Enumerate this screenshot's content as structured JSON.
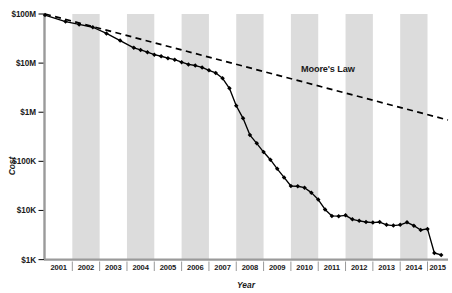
{
  "chart_data": {
    "type": "line",
    "title": "",
    "xlabel": "Year",
    "ylabel": "Cost",
    "yscale": "log",
    "ylim": [
      1000,
      100000000
    ],
    "ytick_labels": [
      "$100M",
      "$10M",
      "$1M",
      "$100K",
      "$10K",
      "$1K"
    ],
    "ytick_values": [
      100000000,
      10000000,
      1000000,
      100000,
      10000,
      1000
    ],
    "xtick_labels": [
      "2001",
      "2002",
      "2003",
      "2004",
      "2005",
      "2006",
      "2007",
      "2008",
      "2009",
      "2010",
      "2011",
      "2012",
      "2013",
      "2014",
      "2015"
    ],
    "xlim": [
      2001,
      2015.75
    ],
    "grid": false,
    "legend_position": "inline-annotation",
    "bands": "alternating vertical gray bands on even years",
    "band_color": "#dcdcdc",
    "line_color": "#000000",
    "marker": "filled-diamond",
    "annotations": [
      {
        "text": "Moore's Law",
        "x": 2011.1,
        "y": 2600000
      }
    ],
    "series": [
      {
        "name": "Cost per Genome",
        "style": "solid-with-markers",
        "x": [
          2001.0,
          2001.75,
          2002.25,
          2002.75,
          2003.25,
          2003.75,
          2004.25,
          2004.5,
          2004.75,
          2005.0,
          2005.25,
          2005.5,
          2005.75,
          2006.0,
          2006.25,
          2006.5,
          2006.75,
          2007.0,
          2007.25,
          2007.5,
          2007.75,
          2008.0,
          2008.25,
          2008.5,
          2008.75,
          2009.0,
          2009.25,
          2009.5,
          2009.75,
          2010.0,
          2010.25,
          2010.5,
          2010.75,
          2011.0,
          2011.25,
          2011.5,
          2011.75,
          2012.0,
          2012.25,
          2012.5,
          2012.75,
          2013.0,
          2013.25,
          2013.5,
          2013.75,
          2014.0,
          2014.25,
          2014.5,
          2014.75,
          2015.0,
          2015.25,
          2015.5
        ],
        "y": [
          95263072,
          70175437,
          61448422,
          53751684,
          40157554,
          28780376,
          20442576,
          18519312,
          16712371,
          14843121,
          13801124,
          12587002,
          11732535,
          10474556,
          9408739,
          8927342,
          8157530,
          7147571,
          6300000,
          4905850,
          3063820,
          1352982,
          752080,
          342502,
          232735,
          154714,
          108065,
          70333,
          47079,
          31512,
          31125,
          29092,
          23092,
          16712,
          10497,
          7743,
          7666,
          7950,
          6618,
          6168,
          5826,
          5671,
          5826,
          5096,
          4920,
          5096,
          5731,
          4905,
          4008,
          4211,
          1363,
          1245
        ]
      },
      {
        "name": "Moore's Law",
        "style": "dashed",
        "x": [
          2001.0,
          2015.75
        ],
        "y": [
          100000000,
          695000
        ]
      }
    ]
  },
  "axes": {
    "y_title": "Cost",
    "x_title": "Year",
    "y_ticks": [
      "$100M",
      "$10M",
      "$1M",
      "$100K",
      "$10K",
      "$1K"
    ],
    "x_ticks": [
      "2001",
      "2002",
      "2003",
      "2004",
      "2005",
      "2006",
      "2007",
      "2008",
      "2009",
      "2010",
      "2011",
      "2012",
      "2013",
      "2014",
      "2015"
    ]
  },
  "annotation": {
    "moores_law": "Moore's Law"
  },
  "colors": {
    "band": "#dcdcdc",
    "line": "#000000",
    "axis": "#808080",
    "text": "#1a1a1a"
  }
}
